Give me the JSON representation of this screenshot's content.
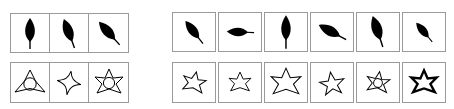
{
  "figure": {
    "type": "shape-grid-comparison",
    "background_color": "#ffffff",
    "cell_border_color": "#9a9a9a",
    "leaf_fill_color": "#000000",
    "star_stroke_color": "#000000",
    "panels": [
      {
        "id": "left-panel",
        "name": "left-panel",
        "columns": 3,
        "rows": [
          {
            "id": "left-leaf-row",
            "name": "leaf-row",
            "shape_class": "leaf",
            "style": "filled",
            "cells": [
              {
                "index": 1,
                "shape": "leaf",
                "fill": "solid-black",
                "rotation_deg": 0,
                "scale": 1.0,
                "stem": true,
                "label": "leaf-upright"
              },
              {
                "index": 2,
                "shape": "leaf",
                "fill": "solid-black",
                "rotation_deg": -20,
                "scale": 0.95,
                "stem": true,
                "label": "leaf-tilted-left"
              },
              {
                "index": 3,
                "shape": "leaf",
                "fill": "solid-black",
                "rotation_deg": -42,
                "scale": 0.92,
                "stem": true,
                "label": "leaf-tilted-more"
              }
            ]
          },
          {
            "id": "left-star-row",
            "name": "star-row",
            "shape_class": "star",
            "style": "outline",
            "cells": [
              {
                "index": 1,
                "shape": "star",
                "points": 3,
                "fill": "none",
                "inscribed_circle": true,
                "rotation_deg": 0,
                "scale": 1.0,
                "stroke_width": 1.0,
                "label": "star-3-point-with-circle"
              },
              {
                "index": 2,
                "shape": "star",
                "points": 4,
                "fill": "none",
                "inscribed_circle": false,
                "rotation_deg": 10,
                "scale": 0.92,
                "stroke_width": 1.0,
                "label": "star-4-point"
              },
              {
                "index": 3,
                "shape": "star",
                "points": 6,
                "fill": "none",
                "inscribed_circle": true,
                "rotation_deg": 0,
                "scale": 1.0,
                "stroke_width": 1.0,
                "label": "star-6-point-with-circle"
              }
            ]
          }
        ]
      },
      {
        "id": "right-panel",
        "name": "right-panel",
        "columns": 6,
        "rows": [
          {
            "id": "right-leaf-row",
            "name": "leaf-row",
            "shape_class": "leaf",
            "style": "filled",
            "cells": [
              {
                "index": 1,
                "shape": "leaf",
                "fill": "solid-black",
                "rotation_deg": -38,
                "scale": 0.92,
                "stem": true,
                "label": "leaf-diagonal-1"
              },
              {
                "index": 2,
                "shape": "leaf",
                "fill": "solid-black",
                "rotation_deg": -88,
                "scale": 0.88,
                "stem": true,
                "label": "leaf-horizontal"
              },
              {
                "index": 3,
                "shape": "leaf",
                "fill": "solid-black",
                "rotation_deg": 0,
                "scale": 1.05,
                "stem": true,
                "label": "leaf-upright"
              },
              {
                "index": 4,
                "shape": "leaf",
                "fill": "solid-black",
                "rotation_deg": -62,
                "scale": 1.0,
                "stem": true,
                "label": "leaf-low-diagonal"
              },
              {
                "index": 5,
                "shape": "leaf",
                "fill": "solid-black",
                "rotation_deg": -18,
                "scale": 1.05,
                "stem": true,
                "label": "leaf-near-upright"
              },
              {
                "index": 6,
                "shape": "leaf",
                "fill": "solid-black",
                "rotation_deg": -40,
                "scale": 0.8,
                "stem": true,
                "label": "leaf-small-diagonal"
              }
            ]
          },
          {
            "id": "right-star-row",
            "name": "star-row",
            "shape_class": "star",
            "style": "outline",
            "cells": [
              {
                "index": 1,
                "shape": "star",
                "points": 6,
                "fill": "none",
                "inscribed_circle": false,
                "rotation_deg": 12,
                "scale": 0.8,
                "stroke_width": 1.0,
                "label": "star-6-small-rotated"
              },
              {
                "index": 2,
                "shape": "star",
                "points": 6,
                "fill": "none",
                "inscribed_circle": false,
                "rotation_deg": 0,
                "scale": 0.78,
                "stroke_width": 1.0,
                "label": "star-6-small"
              },
              {
                "index": 3,
                "shape": "star",
                "points": 6,
                "fill": "none",
                "inscribed_circle": false,
                "rotation_deg": 0,
                "scale": 1.05,
                "stroke_width": 1.0,
                "label": "star-6-large"
              },
              {
                "index": 4,
                "shape": "star",
                "points": 5,
                "fill": "none",
                "inscribed_circle": false,
                "rotation_deg": -8,
                "scale": 0.82,
                "stroke_width": 1.0,
                "label": "star-5-point"
              },
              {
                "index": 5,
                "shape": "star",
                "points": 6,
                "fill": "none",
                "inscribed_circle": true,
                "rotation_deg": 8,
                "scale": 0.8,
                "stroke_width": 1.0,
                "label": "star-6-with-circle"
              },
              {
                "index": 6,
                "shape": "star",
                "points": 6,
                "fill": "none",
                "inscribed_circle": false,
                "rotation_deg": 0,
                "scale": 0.88,
                "stroke_width": 2.6,
                "label": "star-6-bold"
              }
            ]
          }
        ]
      }
    ]
  }
}
